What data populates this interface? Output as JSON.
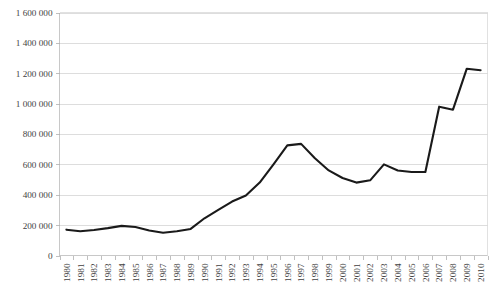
{
  "chart_data": {
    "type": "line",
    "title": "",
    "subtitle": "",
    "xlabel": "",
    "ylabel": "",
    "grid": true,
    "legend": false,
    "legend_position": "none",
    "line_color": "#1a1a1a",
    "grid_color": "#d5d5d5",
    "axis_color": "#c8c8c8",
    "ylim": [
      0,
      1600000
    ],
    "ytick_step": 200000,
    "ytick_labels": [
      "1 600 000",
      "1 400 000",
      "1 200 000",
      "1 000 000",
      "800 000",
      "600 000",
      "400 000",
      "200 000",
      "0"
    ],
    "ytick_values": [
      1600000,
      1400000,
      1200000,
      1000000,
      800000,
      600000,
      400000,
      200000,
      0
    ],
    "categories": [
      "1980",
      "1981",
      "1982",
      "1983",
      "1984",
      "1985",
      "1986",
      "1987",
      "1988",
      "1989",
      "1990",
      "1991",
      "1992",
      "1993",
      "1994",
      "1995",
      "1996",
      "1997",
      "1998",
      "1999",
      "2000",
      "2001",
      "2002",
      "2003",
      "2004",
      "2005",
      "2006",
      "2007",
      "2008",
      "2009",
      "2010"
    ],
    "values": [
      170000,
      160000,
      168000,
      180000,
      195000,
      188000,
      165000,
      150000,
      160000,
      175000,
      245000,
      300000,
      355000,
      395000,
      480000,
      600000,
      725000,
      735000,
      640000,
      560000,
      510000,
      480000,
      495000,
      600000,
      560000,
      550000,
      550000,
      980000,
      960000,
      1230000,
      1220000
    ],
    "series_name": "value"
  }
}
